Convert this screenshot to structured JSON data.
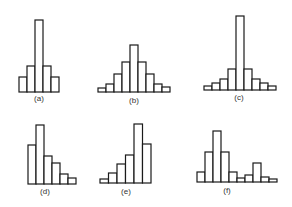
{
  "figure": {
    "bar_fill": "#ffffff",
    "bar_stroke": "#1a1a1a",
    "label_color": "#333333"
  },
  "chart_data": [
    {
      "type": "bar",
      "label": "(a)",
      "title": "",
      "xlabel": "",
      "ylabel": "",
      "categories": [
        "1",
        "2",
        "3",
        "4",
        "5"
      ],
      "values": [
        15,
        26,
        72,
        26,
        15
      ],
      "grid": false,
      "layout": {
        "x0": 19,
        "bar_width": 8,
        "baseline": 92,
        "label_x": 39,
        "label_y": 94
      }
    },
    {
      "type": "bar",
      "label": "(b)",
      "title": "",
      "xlabel": "",
      "ylabel": "",
      "categories": [
        "1",
        "2",
        "3",
        "4",
        "5",
        "6",
        "7",
        "8",
        "9"
      ],
      "values": [
        4,
        8,
        18,
        30,
        47,
        30,
        18,
        8,
        5
      ],
      "grid": false,
      "layout": {
        "x0": 98,
        "bar_width": 8,
        "baseline": 92,
        "label_x": 134,
        "label_y": 96
      }
    },
    {
      "type": "bar",
      "label": "(c)",
      "title": "",
      "xlabel": "",
      "ylabel": "",
      "categories": [
        "1",
        "2",
        "3",
        "4",
        "5",
        "6",
        "7",
        "8",
        "9"
      ],
      "values": [
        4,
        7,
        11,
        21,
        74,
        21,
        11,
        7,
        4
      ],
      "grid": false,
      "layout": {
        "x0": 204,
        "bar_width": 8,
        "baseline": 90,
        "label_x": 239,
        "label_y": 93
      }
    },
    {
      "type": "bar",
      "label": "(d)",
      "title": "",
      "xlabel": "",
      "ylabel": "",
      "categories": [
        "1",
        "2",
        "3",
        "4",
        "5",
        "6"
      ],
      "values": [
        39,
        59,
        28,
        21,
        10,
        6
      ],
      "grid": false,
      "layout": {
        "x0": 28,
        "bar_width": 8,
        "baseline": 184,
        "label_x": 45,
        "label_y": 187
      }
    },
    {
      "type": "bar",
      "label": "(e)",
      "title": "",
      "xlabel": "",
      "ylabel": "",
      "categories": [
        "1",
        "2",
        "3",
        "4",
        "5",
        "6"
      ],
      "values": [
        4,
        10,
        19,
        28,
        59,
        39
      ],
      "grid": false,
      "layout": {
        "x0": 100,
        "bar_width": 8.5,
        "baseline": 183,
        "label_x": 126,
        "label_y": 187
      }
    },
    {
      "type": "bar",
      "label": "(f)",
      "title": "",
      "xlabel": "",
      "ylabel": "",
      "categories": [
        "1",
        "2",
        "3",
        "4",
        "5",
        "6",
        "7",
        "8",
        "9",
        "10"
      ],
      "values": [
        10,
        30,
        51,
        30,
        10,
        4,
        7,
        19,
        5,
        3
      ],
      "grid": false,
      "layout": {
        "x0": 197,
        "bar_width": 8,
        "baseline": 182,
        "label_x": 227,
        "label_y": 186
      }
    }
  ]
}
